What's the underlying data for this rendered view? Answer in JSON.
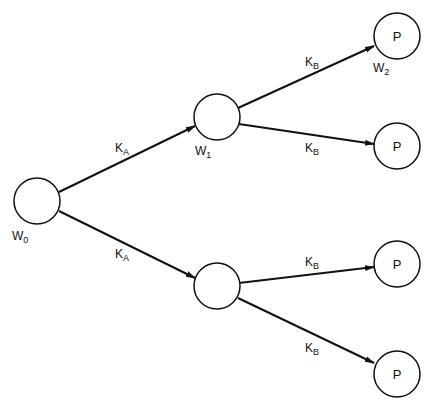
{
  "diagram": {
    "type": "reaction tree",
    "nodes": [
      {
        "id": "w0",
        "label": "",
        "caption": "W",
        "sub": "0"
      },
      {
        "id": "w1",
        "label": "",
        "caption": "W",
        "sub": "1"
      },
      {
        "id": "lower",
        "label": "",
        "caption": "",
        "sub": ""
      },
      {
        "id": "p1",
        "label": "P",
        "caption": "W",
        "sub": "2"
      },
      {
        "id": "p2",
        "label": "P",
        "caption": "",
        "sub": ""
      },
      {
        "id": "p3",
        "label": "P",
        "caption": "",
        "sub": ""
      },
      {
        "id": "p4",
        "label": "P",
        "caption": "",
        "sub": ""
      }
    ],
    "edges": [
      {
        "from": "w0",
        "to": "w1",
        "label": "K",
        "sub": "A"
      },
      {
        "from": "w0",
        "to": "lower",
        "label": "K",
        "sub": "A"
      },
      {
        "from": "w1",
        "to": "p1",
        "label": "K",
        "sub": "B"
      },
      {
        "from": "w1",
        "to": "p2",
        "label": "K",
        "sub": "B"
      },
      {
        "from": "lower",
        "to": "p3",
        "label": "K",
        "sub": "B"
      },
      {
        "from": "lower",
        "to": "p4",
        "label": "K",
        "sub": "B"
      }
    ]
  }
}
